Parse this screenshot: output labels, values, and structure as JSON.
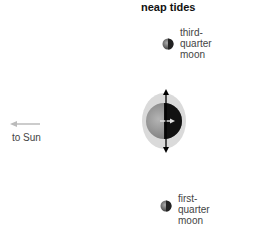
{
  "title": "neap tides",
  "third_quarter": {
    "lines": [
      "third-",
      "quarter",
      "moon"
    ]
  },
  "first_quarter": {
    "lines": [
      "first-",
      "quarter",
      "moon"
    ]
  },
  "sun_label": "to Sun",
  "colors": {
    "tidal_bulge": "#d9d9d9",
    "earth_day": "#9a9a9a",
    "earth_night": "#111111",
    "sun_arrow": "#bbbbbb",
    "axis_arrow": "#000000"
  }
}
